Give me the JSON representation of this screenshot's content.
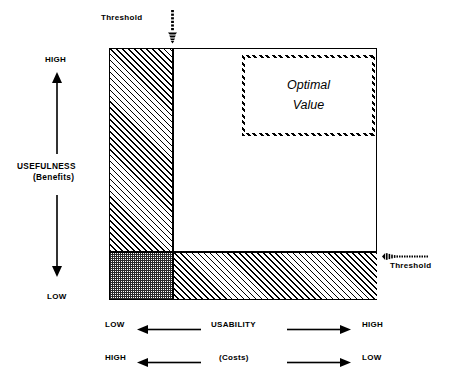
{
  "diagram": {
    "vertical_axis": {
      "high_label": "HIGH",
      "low_label": "LOW",
      "name": "USEFULNESS",
      "sub_name": "(Benefits)"
    },
    "horizontal_axis": {
      "primary": {
        "left_label": "LOW",
        "name": "USABILITY",
        "right_label": "HIGH"
      },
      "secondary": {
        "left_label": "HIGH",
        "name": "(Costs)",
        "right_label": "LOW"
      }
    },
    "thresholds": {
      "top_label": "Threshold",
      "right_label": "Threshold"
    },
    "optimal_region": {
      "line1": "Optimal",
      "line2": "Value"
    },
    "colors": {
      "ink": "#000000",
      "paper": "#ffffff",
      "checker_fill": "#2b2b2b"
    }
  }
}
